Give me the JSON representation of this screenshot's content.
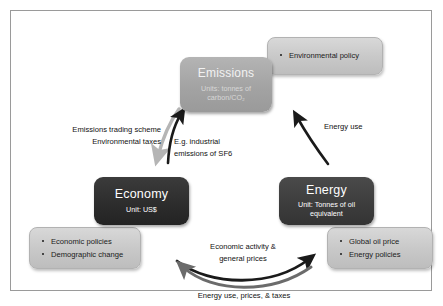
{
  "diagram": {
    "frame": {
      "border_color": "#9a9a9a",
      "background": "#ffffff"
    }
  },
  "nodes": [
    {
      "id": "emissions",
      "title": "Emissions",
      "subtitle": "Units: tonnes of carbon/CO₂",
      "subtitle_line1": "Units: tonnes of",
      "subtitle_line2": "carbon/CO₂",
      "fill": "#a3a3a3",
      "text_color": "#f2f2f2"
    },
    {
      "id": "economy",
      "title": "Economy",
      "subtitle": "Unit: US$",
      "fill": "#2c2c2c",
      "text_color": "#ffffff"
    },
    {
      "id": "energy",
      "title": "Energy",
      "subtitle": "Unit: Tonnes of oil equivalent",
      "subtitle_line1": "Unit: Tonnes of oil",
      "subtitle_line2": "equivalent",
      "fill": "#3c3c3c",
      "text_color": "#ffffff"
    }
  ],
  "infoboxes": [
    {
      "id": "environmental-policy",
      "attached_to": "emissions",
      "items": [
        "Environmental policy"
      ],
      "fill": "#c9c9c9"
    },
    {
      "id": "economy-drivers",
      "attached_to": "economy",
      "items": [
        "Economic policies",
        "Demographic change"
      ],
      "fill": "#c9c9c9"
    },
    {
      "id": "energy-drivers",
      "attached_to": "energy",
      "items": [
        "Global oil price",
        "Energy policies"
      ],
      "fill": "#c9c9c9"
    }
  ],
  "arrow_labels": {
    "emissions_to_economy_line1": "Emissions trading scheme",
    "emissions_to_economy_line2": "Environmental taxes",
    "economy_to_emissions_line1": "E.g. industrial",
    "economy_to_emissions_line2": "emissions of SF6",
    "energy_to_emissions": "Energy use",
    "energy_to_economy_line1": "Economic activity &",
    "energy_to_economy_line2": "general prices",
    "economy_to_energy": "Energy use, prices, & taxes"
  },
  "arrows": [
    {
      "id": "emissions-to-economy",
      "from": "Emissions",
      "to": "Economy",
      "color": "#b5b5b5",
      "style": "curved"
    },
    {
      "id": "economy-to-emissions",
      "from": "Economy",
      "to": "Emissions",
      "color": "#1a1a1a",
      "style": "curved"
    },
    {
      "id": "energy-to-emissions",
      "from": "Energy",
      "to": "Emissions",
      "color": "#1a1a1a",
      "style": "curved"
    },
    {
      "id": "economy-to-energy",
      "from": "Economy",
      "to": "Energy",
      "color": "#1a1a1a",
      "style": "curved"
    },
    {
      "id": "energy-to-economy",
      "from": "Energy",
      "to": "Economy",
      "color": "#6b6b6b",
      "style": "curved"
    }
  ]
}
